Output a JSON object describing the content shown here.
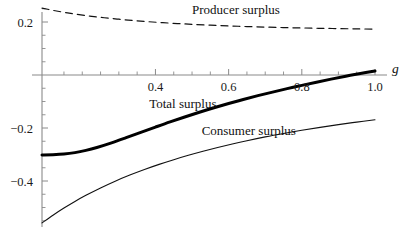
{
  "chart_data": {
    "type": "line",
    "title": "",
    "xlabel": "g",
    "ylabel": "",
    "xlim": [
      0.09,
      1.0
    ],
    "ylim": [
      -0.58,
      0.26
    ],
    "grid": false,
    "legend_position": "inline-annotations",
    "xticks_major": [
      "0.4",
      "0.6",
      "0.8",
      "1.0"
    ],
    "xtick_major_values": [
      0.4,
      0.6,
      0.8,
      1.0
    ],
    "xtick_minor_values": [
      0.15,
      0.2,
      0.25,
      0.3,
      0.35,
      0.45,
      0.5,
      0.55,
      0.65,
      0.7,
      0.75,
      0.85,
      0.9,
      0.95
    ],
    "yticks_major": [
      "0.2",
      "-0.2",
      "-0.4"
    ],
    "ytick_major_values": [
      0.2,
      -0.2,
      -0.4
    ],
    "ytick_minor_values": [
      0.25,
      0.15,
      0.1,
      0.05,
      -0.05,
      -0.1,
      -0.15,
      -0.25,
      -0.3,
      -0.35,
      -0.45,
      -0.5,
      -0.55
    ],
    "series": [
      {
        "name": "Producer surplus",
        "style": "dashed",
        "width": 1.2,
        "color": "#111111",
        "label_x": 0.62,
        "label_y": 0.232,
        "x": [
          0.09,
          0.12,
          0.15,
          0.18,
          0.22,
          0.26,
          0.3,
          0.34,
          0.38,
          0.42,
          0.46,
          0.5,
          0.55,
          0.6,
          0.65,
          0.7,
          0.75,
          0.8,
          0.85,
          0.9,
          0.95,
          1.0
        ],
        "values": [
          0.2525,
          0.244,
          0.2365,
          0.23,
          0.2225,
          0.216,
          0.2105,
          0.2055,
          0.2012,
          0.1975,
          0.1942,
          0.1912,
          0.188,
          0.1852,
          0.1828,
          0.1808,
          0.179,
          0.1775,
          0.1762,
          0.175,
          0.174,
          0.173
        ]
      },
      {
        "name": "Total surplus",
        "style": "solid",
        "width": 3.0,
        "color": "#000000",
        "label_x": 0.475,
        "label_y": -0.123,
        "x": [
          0.09,
          0.12,
          0.15,
          0.18,
          0.21,
          0.24,
          0.28,
          0.32,
          0.36,
          0.4,
          0.44,
          0.48,
          0.52,
          0.56,
          0.6,
          0.64,
          0.68,
          0.72,
          0.76,
          0.8,
          0.84,
          0.88,
          0.92,
          0.96,
          1.0
        ],
        "values": [
          -0.302,
          -0.301,
          -0.2985,
          -0.293,
          -0.2845,
          -0.2735,
          -0.256,
          -0.2365,
          -0.2165,
          -0.1965,
          -0.177,
          -0.1585,
          -0.1405,
          -0.1235,
          -0.1075,
          -0.0925,
          -0.078,
          -0.0645,
          -0.0515,
          -0.039,
          -0.027,
          -0.0155,
          -0.0045,
          0.0055,
          0.015
        ]
      },
      {
        "name": "Consumer surplus",
        "style": "solid",
        "width": 1.1,
        "color": "#111111",
        "label_x": 0.655,
        "label_y": -0.228,
        "x": [
          0.09,
          0.12,
          0.15,
          0.18,
          0.21,
          0.25,
          0.29,
          0.33,
          0.37,
          0.41,
          0.45,
          0.49,
          0.53,
          0.57,
          0.61,
          0.65,
          0.7,
          0.75,
          0.8,
          0.85,
          0.9,
          0.95,
          1.0
        ],
        "values": [
          -0.558,
          -0.529,
          -0.502,
          -0.477,
          -0.454,
          -0.426,
          -0.4005,
          -0.3775,
          -0.3565,
          -0.3372,
          -0.3195,
          -0.303,
          -0.2877,
          -0.2735,
          -0.2602,
          -0.2478,
          -0.2335,
          -0.2205,
          -0.2085,
          -0.1975,
          -0.1872,
          -0.1777,
          -0.169
        ]
      }
    ]
  },
  "labels": {
    "producer": "Producer surplus",
    "total": "Total surplus",
    "consumer": "Consumer surplus",
    "x_axis": "g",
    "y_02": "0.2",
    "y_m02": "−0.2",
    "y_m04": "−0.4",
    "x_04": "0.4",
    "x_06": "0.6",
    "x_08": "0.8",
    "x_10": "1.0"
  },
  "colors": {
    "axis": "#8a8a8a",
    "curve": "#111111",
    "background": "#ffffff"
  }
}
